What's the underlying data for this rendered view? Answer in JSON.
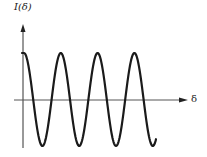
{
  "chart_data": {
    "type": "line",
    "title": "",
    "xlabel": "δ",
    "ylabel": "I(δ)",
    "grid": false,
    "legend": null,
    "axis_ticks": false,
    "series": [
      {
        "name": "I(δ)",
        "function": "cos",
        "amplitude": 1,
        "periods_shown": 3.6,
        "peaks_at_x_px": [
          24,
          57,
          94,
          131
        ],
        "troughs_at_x_px": [
          38,
          75,
          111,
          148
        ],
        "color": "#1a1a1a"
      }
    ]
  },
  "labels": {
    "y_axis": "I(δ)",
    "x_axis": "δ"
  }
}
